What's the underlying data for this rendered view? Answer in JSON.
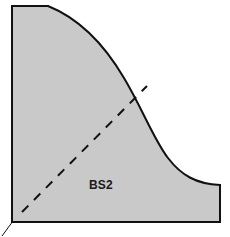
{
  "diagram": {
    "type": "profile-cross-section",
    "label": "BS2",
    "colors": {
      "background": "#ffffff",
      "fill": "#c9c9c9",
      "outline": "#111111",
      "dashed_line": "#111111",
      "label_text": "#1a1a1a"
    },
    "geometry": {
      "units": "pixels",
      "canvas": {
        "width": 230,
        "height": 237
      },
      "outline_path": "M 12,6 L 48,6 C 92,28 140,92 166,150 C 182,176 196,184 220,185 L 220,222 L 12,222 Z",
      "top_edge": {
        "x1": 12,
        "y1": 6,
        "x2": 48,
        "y2": 6
      },
      "left_edge": {
        "x1": 12,
        "y1": 6,
        "x2": 12,
        "y2": 222
      },
      "bottom_edge": {
        "x1": 12,
        "y1": 222,
        "x2": 220,
        "y2": 222
      },
      "right_edge": {
        "x1": 220,
        "y1": 185,
        "x2": 220,
        "y2": 222
      },
      "concave_curve": {
        "start_x": 48,
        "start_y": 6,
        "end_x": 220,
        "end_y": 185
      },
      "dashed_line": {
        "x1": 22,
        "y1": 212,
        "x2": 147,
        "y2": 86,
        "dash": 9,
        "gap": 8,
        "width": 2
      },
      "corner_tick": {
        "x1": 12,
        "y1": 222,
        "x2": 2,
        "y2": 236,
        "width": 1
      },
      "label_position": {
        "x": 89,
        "y": 178
      }
    },
    "stroke_widths": {
      "outline": 2,
      "dashed_line": 2,
      "corner_tick": 1
    }
  }
}
